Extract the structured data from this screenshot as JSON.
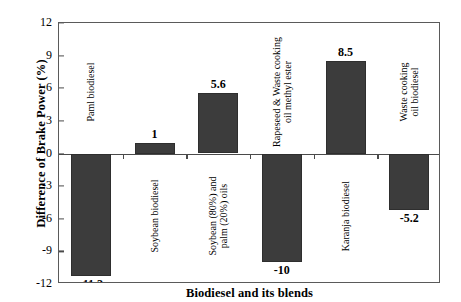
{
  "chart_data": {
    "type": "bar",
    "title": "",
    "xlabel": "Biodiesel and its blends",
    "ylabel": "Difference of Brake Power (%)",
    "ylim": [
      -12,
      12
    ],
    "yticks": [
      "12",
      "9",
      "6",
      "3",
      "0",
      "-3",
      "-6",
      "-9",
      "-12"
    ],
    "grid": false,
    "legend": false,
    "bar_color": "#3c3c3c",
    "categories": [
      "Paml biodiesel",
      "Soybean biodiesel",
      "Soybean (80%) and\npalm (20%) oils",
      "Rapeseed & Waste cooking\noil methyl ester",
      "Karanja biodiesel",
      "Waste cooking\noil biodiesel"
    ],
    "values": [
      -11.3,
      1,
      5.6,
      -10,
      8.5,
      -5.2
    ],
    "value_labels": [
      "-11.3",
      "1",
      "5.6",
      "-10",
      "8.5",
      "-5.2"
    ]
  }
}
